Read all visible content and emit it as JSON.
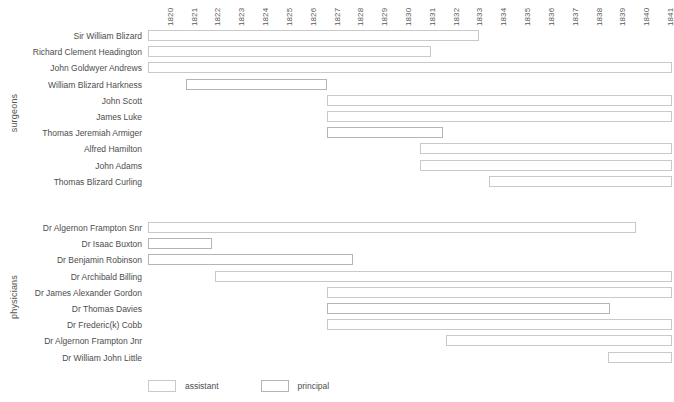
{
  "chart_data": {
    "type": "bar",
    "title": "",
    "subtitle": "",
    "xlabel": "",
    "ylabel": "",
    "grid": false,
    "orientation": "horizontal",
    "chart_style": "gantt-timeline",
    "xlim": [
      1819.5,
      1841.5
    ],
    "x_tick_labels": [
      "1820",
      "1821",
      "1822",
      "1823",
      "1824",
      "1825",
      "1826",
      "1827",
      "1828",
      "1829",
      "1830",
      "1831",
      "1832",
      "1833",
      "1834",
      "1835",
      "1836",
      "1837",
      "1838",
      "1839",
      "1840",
      "1841"
    ],
    "legend": {
      "position": "bottom-left",
      "entries": [
        {
          "key": "assistant",
          "label": "assistant",
          "color": "#c9c9c9"
        },
        {
          "key": "principal",
          "label": "principal",
          "color": "#b4b4b4"
        }
      ]
    },
    "groups": [
      {
        "name": "surgeons",
        "label": "surgeons",
        "rows": [
          {
            "label": "Sir William Blizard",
            "segments": [
              {
                "role": "assistant",
                "start": 1819.5,
                "end": 1833.4
              }
            ]
          },
          {
            "label": "Richard Clement Headington",
            "segments": [
              {
                "role": "assistant",
                "start": 1819.5,
                "end": 1831.4
              }
            ]
          },
          {
            "label": "John Goldwyer Andrews",
            "segments": [
              {
                "role": "assistant",
                "start": 1819.5,
                "end": 1841.5
              }
            ]
          },
          {
            "label": "William Blizard Harkness",
            "segments": [
              {
                "role": "principal",
                "start": 1821.1,
                "end": 1827.0
              }
            ]
          },
          {
            "label": "John Scott",
            "segments": [
              {
                "role": "assistant",
                "start": 1827.0,
                "end": 1841.5
              }
            ]
          },
          {
            "label": "James Luke",
            "segments": [
              {
                "role": "assistant",
                "start": 1827.0,
                "end": 1841.5
              }
            ]
          },
          {
            "label": "Thomas Jeremiah Armiger",
            "segments": [
              {
                "role": "principal",
                "start": 1827.0,
                "end": 1831.9
              }
            ]
          },
          {
            "label": "Alfred Hamilton",
            "segments": [
              {
                "role": "assistant",
                "start": 1830.9,
                "end": 1841.5
              }
            ]
          },
          {
            "label": "John Adams",
            "segments": [
              {
                "role": "assistant",
                "start": 1830.9,
                "end": 1841.5
              }
            ]
          },
          {
            "label": "Thomas Blizard Curling",
            "segments": [
              {
                "role": "assistant",
                "start": 1833.8,
                "end": 1841.5
              }
            ]
          }
        ]
      },
      {
        "name": "physicians",
        "label": "physicians",
        "rows": [
          {
            "label": "Dr Algernon Frampton Snr",
            "segments": [
              {
                "role": "assistant",
                "start": 1819.5,
                "end": 1840.0
              }
            ]
          },
          {
            "label": "Dr Isaac Buxton",
            "segments": [
              {
                "role": "principal",
                "start": 1819.5,
                "end": 1822.2
              }
            ]
          },
          {
            "label": "Dr Benjamin Robinson",
            "segments": [
              {
                "role": "principal",
                "start": 1819.5,
                "end": 1828.1
              }
            ]
          },
          {
            "label": "Dr Archibald Billing",
            "segments": [
              {
                "role": "assistant",
                "start": 1822.3,
                "end": 1841.5
              }
            ]
          },
          {
            "label": "Dr James Alexander Gordon",
            "segments": [
              {
                "role": "assistant",
                "start": 1827.0,
                "end": 1841.5
              }
            ]
          },
          {
            "label": "Dr Thomas Davies",
            "segments": [
              {
                "role": "principal",
                "start": 1827.0,
                "end": 1838.9
              }
            ]
          },
          {
            "label": "Dr Frederic(k) Cobb",
            "segments": [
              {
                "role": "assistant",
                "start": 1827.0,
                "end": 1841.5
              }
            ]
          },
          {
            "label": "Dr Algernon Frampton Jnr",
            "segments": [
              {
                "role": "assistant",
                "start": 1832.0,
                "end": 1841.5
              }
            ]
          },
          {
            "label": "Dr William John Little",
            "segments": [
              {
                "role": "assistant",
                "start": 1838.8,
                "end": 1841.5
              }
            ]
          }
        ]
      }
    ]
  }
}
